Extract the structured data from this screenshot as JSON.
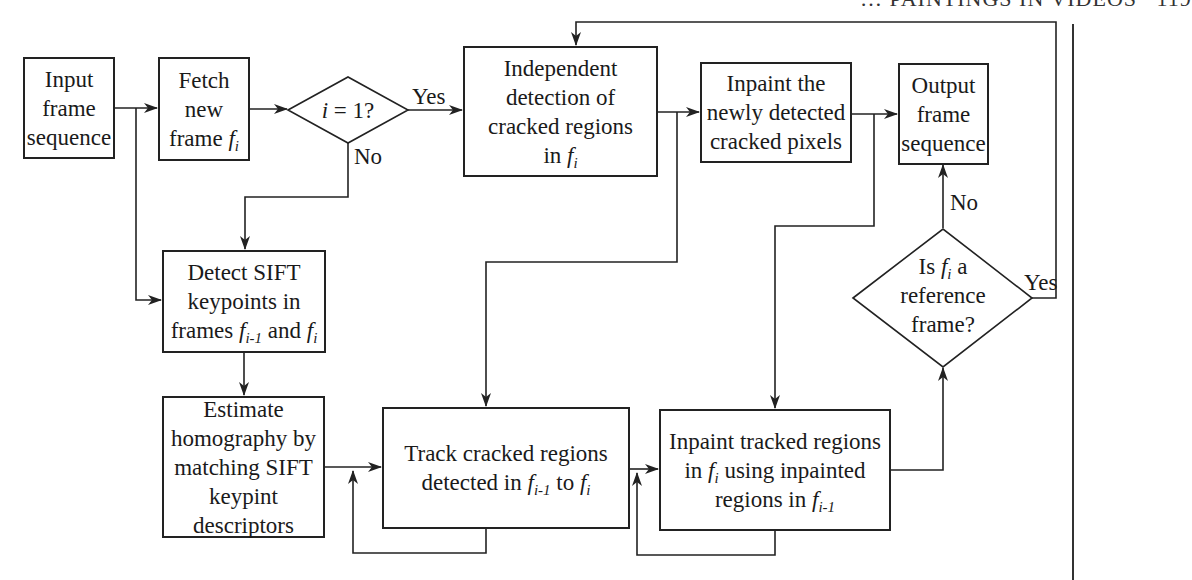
{
  "header": {
    "running_title": "… PAINTINGS IN VIDEOS",
    "page_number": "119"
  },
  "nodes": {
    "input": {
      "lines": [
        "Input",
        "frame",
        "sequence"
      ]
    },
    "fetch": {
      "lines": [
        "Fetch",
        "new",
        "frame"
      ],
      "var": "f",
      "sub": "i"
    },
    "decision1": {
      "text_var": "i",
      "text_rest": " = 1?"
    },
    "independent": {
      "lines": [
        "Independent",
        "detection of",
        "cracked regions",
        "in "
      ],
      "var": "f",
      "sub": "i"
    },
    "inpaint_new": {
      "lines": [
        "Inpaint the",
        "newly detected",
        "cracked pixels"
      ]
    },
    "output": {
      "lines": [
        "Output",
        "frame",
        "sequence"
      ]
    },
    "detect_sift": {
      "lines": [
        "Detect SIFT",
        "keypoints in",
        "frames "
      ],
      "var1": "f",
      "sub1": "i-1",
      "mid": " and ",
      "var2": "f",
      "sub2": "i"
    },
    "estimate": {
      "lines": [
        "Estimate",
        "homography by",
        "matching SIFT",
        "keypint",
        "descriptors"
      ]
    },
    "track": {
      "line1": "Track cracked regions",
      "line2_pre": "detected in ",
      "var1": "f",
      "sub1": "i-1",
      "mid": " to ",
      "var2": "f",
      "sub2": "i"
    },
    "inpaint_tracked": {
      "line1": "Inpaint tracked regions",
      "pre": "in ",
      "var1": "f",
      "sub1": "i",
      "mid": " using inpainted",
      "line3_pre": "regions in ",
      "var2": "f",
      "sub2": "i-1"
    },
    "decision2": {
      "pre": "Is ",
      "var": "f",
      "sub": "i",
      "post": " a",
      "line2": "reference",
      "line3": "frame?"
    }
  },
  "edge_labels": {
    "d1_yes": "Yes",
    "d1_no": "No",
    "d2_yes": "Yes",
    "d2_no": "No"
  },
  "colors": {
    "stroke": "#222222",
    "background": "#ffffff"
  }
}
